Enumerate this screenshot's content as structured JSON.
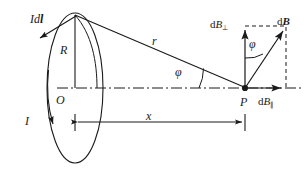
{
  "figure": {
    "type": "physics-vector-diagram",
    "width": 307,
    "height": 177,
    "background_color": "#ffffff",
    "line_color": "#1a1a1a"
  },
  "labels": {
    "current_element": "Idl",
    "current_element_parts": {
      "current": "I",
      "element": "dl"
    },
    "radius": "R",
    "center": "O",
    "current": "I",
    "distance_r": "r",
    "angle_axis": "φ",
    "angle_vector": "φ",
    "axial_distance": "x",
    "field_point": "P",
    "field_perp_prefix": "dB",
    "field_perp_sub": "⊥",
    "field_total_prefix": "d",
    "field_total_vec": "B",
    "field_par_prefix": "dB",
    "field_par_sub": "∥"
  },
  "geometry": {
    "loop_center": {
      "x": 75,
      "y": 88
    },
    "loop_rx": 28,
    "loop_ry": 75,
    "apex": {
      "x": 75,
      "y": 15
    },
    "field_point": {
      "x": 245,
      "y": 88
    },
    "vector_tip": {
      "x": 285,
      "y": 30
    },
    "axis_y": 88,
    "dimension_line_y": 122,
    "dimension_start_x": 75,
    "dimension_end_x": 245
  },
  "elements": {
    "loop": "current-carrying circular loop shown in perspective as an ellipse",
    "axis": "dash-dot symmetry axis through O and P",
    "r_line": "line from current element at loop top to field point P",
    "dB_vector": "total magnetic field contribution at P",
    "dB_perp_vector": "perpendicular component of dB",
    "dB_par_vector": "parallel (axial) component of dB",
    "dashed_box": "dashed construction rectangle for vector components"
  }
}
